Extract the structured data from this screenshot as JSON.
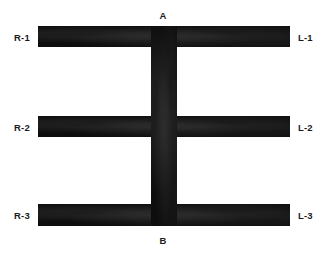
{
  "figure": {
    "title": "",
    "background_color": "#ffffff",
    "ink_color": "#0d0d0d",
    "labels": {
      "top": "A",
      "bottom": "B",
      "left": [
        "R-1",
        "R-2",
        "R-3"
      ],
      "right": [
        "L-1",
        "L-2",
        "L-3"
      ]
    }
  },
  "labels": {
    "a": "A",
    "b": "B",
    "r1": "R-1",
    "r2": "R-2",
    "r3": "R-3",
    "l1": "L-1",
    "l2": "L-2",
    "l3": "L-3"
  }
}
